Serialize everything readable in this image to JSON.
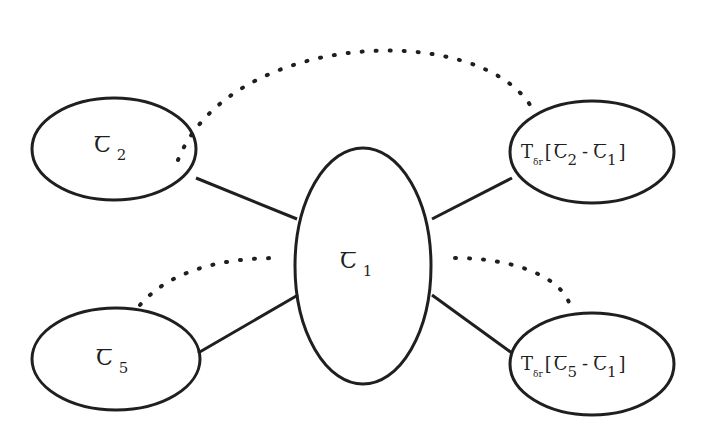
{
  "diagram": {
    "type": "node-link",
    "nodes": [
      {
        "id": "c1",
        "symbol": "Ꞇ",
        "subscript": "1",
        "label": "𝔗1 (center)"
      },
      {
        "id": "c2",
        "symbol": "Ꞇ",
        "subscript": "2",
        "label": "𝔗2"
      },
      {
        "id": "c5",
        "symbol": "Ꞇ",
        "subscript": "5",
        "label": "𝔗5"
      },
      {
        "id": "t21",
        "prefix": "T",
        "prefix_sub": "δr",
        "bracket_open": "[",
        "a_sym": "Ꞇ",
        "a_sub": "2",
        "minus": "-",
        "b_sym": "Ꞇ",
        "b_sub": "1",
        "bracket_close": "]",
        "label": "T_δr[𝔗2 - 𝔗1]"
      },
      {
        "id": "t51",
        "prefix": "T",
        "prefix_sub": "δr",
        "bracket_open": "[",
        "a_sym": "Ꞇ",
        "a_sub": "5",
        "minus": "-",
        "b_sym": "Ꞇ",
        "b_sub": "1",
        "bracket_close": "]",
        "label": "T_δr[𝔗5 - 𝔗1]"
      }
    ],
    "edges": [
      {
        "from": "c2",
        "to": "c1",
        "style": "solid"
      },
      {
        "from": "c5",
        "to": "c1",
        "style": "solid"
      },
      {
        "from": "t21",
        "to": "c1",
        "style": "solid"
      },
      {
        "from": "t51",
        "to": "c1",
        "style": "solid"
      },
      {
        "from": "c2",
        "to": "t21",
        "style": "dotted"
      },
      {
        "from": "c5",
        "to": "c1",
        "style": "dotted",
        "note": "partial arc toward center"
      },
      {
        "from": "c1",
        "to": "t51",
        "style": "dotted",
        "note": "partial arc from center"
      }
    ],
    "colors": {
      "stroke": "#1f1f1f",
      "background": "#ffffff"
    }
  }
}
